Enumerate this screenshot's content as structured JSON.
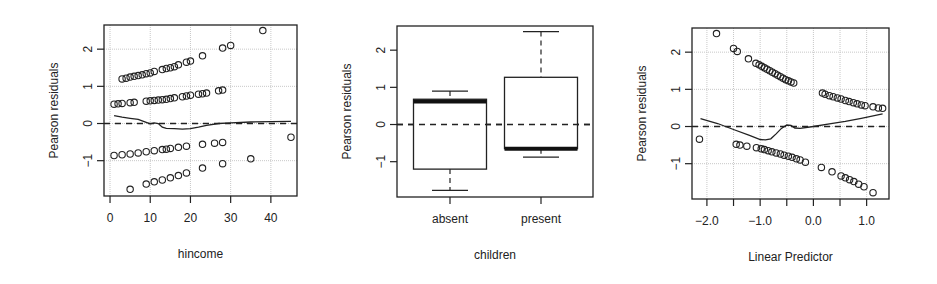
{
  "chart_data": [
    {
      "type": "scatter",
      "title": "",
      "xlabel": "hincome",
      "ylabel": "Pearson residuals",
      "xlim": [
        -1.5,
        46.5
      ],
      "ylim": [
        -1.95,
        2.65
      ],
      "xticks": [
        0,
        10,
        20,
        30,
        40
      ],
      "xtick_labels": [
        "0",
        "10",
        "20",
        "30",
        "40"
      ],
      "yticks": [
        -1,
        0,
        1,
        2
      ],
      "ytick_labels": [
        "-1",
        "0",
        "1",
        "2"
      ],
      "grid": true,
      "reference_line": {
        "y": 0,
        "style": "dashed"
      },
      "points": [
        [
          3,
          1.2
        ],
        [
          4,
          1.22
        ],
        [
          5,
          1.25
        ],
        [
          6,
          1.27
        ],
        [
          7,
          1.29
        ],
        [
          8,
          1.31
        ],
        [
          9,
          1.34
        ],
        [
          10,
          1.36
        ],
        [
          11,
          1.4
        ],
        [
          13,
          1.45
        ],
        [
          14,
          1.48
        ],
        [
          15,
          1.5
        ],
        [
          16,
          1.53
        ],
        [
          17,
          1.58
        ],
        [
          19,
          1.65
        ],
        [
          20,
          1.68
        ],
        [
          23,
          1.82
        ],
        [
          28,
          2.03
        ],
        [
          30,
          2.1
        ],
        [
          38,
          2.5
        ],
        [
          1,
          0.52
        ],
        [
          2,
          0.53
        ],
        [
          3,
          0.54
        ],
        [
          5,
          0.56
        ],
        [
          6,
          0.57
        ],
        [
          9,
          0.6
        ],
        [
          10,
          0.61
        ],
        [
          11,
          0.62
        ],
        [
          12,
          0.63
        ],
        [
          13,
          0.64
        ],
        [
          14,
          0.65
        ],
        [
          15,
          0.67
        ],
        [
          16,
          0.69
        ],
        [
          18,
          0.72
        ],
        [
          19,
          0.74
        ],
        [
          20,
          0.76
        ],
        [
          22,
          0.79
        ],
        [
          23,
          0.8
        ],
        [
          24,
          0.82
        ],
        [
          27,
          0.88
        ],
        [
          28,
          0.9
        ],
        [
          1,
          -0.86
        ],
        [
          3,
          -0.84
        ],
        [
          5,
          -0.82
        ],
        [
          7,
          -0.79
        ],
        [
          9,
          -0.76
        ],
        [
          11,
          -0.73
        ],
        [
          13,
          -0.7
        ],
        [
          14,
          -0.69
        ],
        [
          15,
          -0.67
        ],
        [
          17,
          -0.64
        ],
        [
          19,
          -0.61
        ],
        [
          23,
          -0.56
        ],
        [
          26,
          -0.53
        ],
        [
          28,
          -0.51
        ],
        [
          45,
          -0.37
        ],
        [
          5,
          -1.77
        ],
        [
          9,
          -1.63
        ],
        [
          11,
          -1.57
        ],
        [
          13,
          -1.52
        ],
        [
          15,
          -1.46
        ],
        [
          17,
          -1.4
        ],
        [
          19,
          -1.33
        ],
        [
          23,
          -1.2
        ],
        [
          28,
          -1.08
        ],
        [
          35,
          -0.95
        ]
      ],
      "smooth_line": [
        [
          1,
          0.21
        ],
        [
          3,
          0.17
        ],
        [
          5,
          0.14
        ],
        [
          7,
          0.11
        ],
        [
          9,
          0.03
        ],
        [
          10,
          -0.01
        ],
        [
          11,
          0.02
        ],
        [
          12,
          0.0
        ],
        [
          13,
          -0.1
        ],
        [
          14,
          -0.13
        ],
        [
          16,
          -0.14
        ],
        [
          18,
          -0.15
        ],
        [
          20,
          -0.14
        ],
        [
          22,
          -0.1
        ],
        [
          24,
          -0.05
        ],
        [
          27,
          0.0
        ],
        [
          30,
          0.02
        ],
        [
          35,
          0.04
        ],
        [
          40,
          0.05
        ],
        [
          45,
          0.06
        ]
      ]
    },
    {
      "type": "box",
      "title": "",
      "xlabel": "children",
      "ylabel": "Pearson residuals",
      "ylim": [
        -1.95,
        2.65
      ],
      "categories": [
        "absent",
        "present"
      ],
      "yticks": [
        -1,
        0,
        1,
        2
      ],
      "ytick_labels": [
        "-1",
        "0",
        "1",
        "2"
      ],
      "grid": false,
      "reference_line": {
        "y": 0,
        "style": "dashed"
      },
      "boxes": [
        {
          "category": "absent",
          "whisker_low": -1.77,
          "q1": -1.2,
          "median": 0.62,
          "q3": 0.68,
          "whisker_high": 0.9
        },
        {
          "category": "present",
          "whisker_low": -0.88,
          "q1": -0.65,
          "median": -0.65,
          "q3": 1.27,
          "whisker_high": 2.5
        }
      ]
    },
    {
      "type": "scatter",
      "title": "",
      "xlabel": "Linear Predictor",
      "ylabel": "Pearson residuals",
      "xlim": [
        -2.28,
        1.42
      ],
      "ylim": [
        -1.95,
        2.65
      ],
      "xticks": [
        -2.0,
        -1.5,
        -1.0,
        -0.5,
        0.0,
        0.5,
        1.0
      ],
      "xtick_labels": [
        "-2.0",
        "",
        "-1.0",
        "",
        "0.0",
        "",
        "1.0"
      ],
      "yticks": [
        -1,
        0,
        1,
        2
      ],
      "ytick_labels": [
        "-1",
        "0",
        "1",
        "2"
      ],
      "grid": true,
      "reference_line": {
        "y": 0,
        "style": "dashed"
      },
      "points": [
        [
          -1.82,
          2.5
        ],
        [
          -1.5,
          2.1
        ],
        [
          -1.43,
          2.02
        ],
        [
          -1.22,
          1.82
        ],
        [
          -1.08,
          1.7
        ],
        [
          -1.02,
          1.66
        ],
        [
          -0.97,
          1.62
        ],
        [
          -0.92,
          1.58
        ],
        [
          -0.87,
          1.54
        ],
        [
          -0.82,
          1.5
        ],
        [
          -0.77,
          1.46
        ],
        [
          -0.72,
          1.42
        ],
        [
          -0.67,
          1.38
        ],
        [
          -0.62,
          1.34
        ],
        [
          -0.57,
          1.3
        ],
        [
          -0.52,
          1.26
        ],
        [
          -0.47,
          1.23
        ],
        [
          -0.42,
          1.2
        ],
        [
          -0.37,
          1.17
        ],
        [
          0.17,
          0.9
        ],
        [
          0.22,
          0.87
        ],
        [
          0.3,
          0.83
        ],
        [
          0.37,
          0.8
        ],
        [
          0.45,
          0.77
        ],
        [
          0.52,
          0.74
        ],
        [
          0.6,
          0.7
        ],
        [
          0.67,
          0.67
        ],
        [
          0.75,
          0.64
        ],
        [
          0.82,
          0.61
        ],
        [
          0.9,
          0.58
        ],
        [
          0.97,
          0.56
        ],
        [
          1.12,
          0.53
        ],
        [
          1.22,
          0.5
        ],
        [
          1.3,
          0.49
        ],
        [
          -2.14,
          -0.34
        ],
        [
          -1.45,
          -0.48
        ],
        [
          -1.38,
          -0.5
        ],
        [
          -1.25,
          -0.53
        ],
        [
          -1.07,
          -0.57
        ],
        [
          -0.98,
          -0.6
        ],
        [
          -0.92,
          -0.62
        ],
        [
          -0.85,
          -0.65
        ],
        [
          -0.78,
          -0.68
        ],
        [
          -0.7,
          -0.71
        ],
        [
          -0.62,
          -0.74
        ],
        [
          -0.55,
          -0.77
        ],
        [
          -0.47,
          -0.8
        ],
        [
          -0.4,
          -0.83
        ],
        [
          -0.32,
          -0.87
        ],
        [
          -0.25,
          -0.9
        ],
        [
          -0.15,
          -0.96
        ],
        [
          0.15,
          -1.1
        ],
        [
          0.35,
          -1.22
        ],
        [
          0.52,
          -1.33
        ],
        [
          0.6,
          -1.38
        ],
        [
          0.68,
          -1.43
        ],
        [
          0.76,
          -1.48
        ],
        [
          0.85,
          -1.55
        ],
        [
          0.95,
          -1.62
        ],
        [
          1.12,
          -1.78
        ]
      ],
      "smooth_line": [
        [
          -2.12,
          0.21
        ],
        [
          -1.8,
          0.08
        ],
        [
          -1.5,
          -0.08
        ],
        [
          -1.2,
          -0.24
        ],
        [
          -1.0,
          -0.35
        ],
        [
          -0.9,
          -0.36
        ],
        [
          -0.8,
          -0.33
        ],
        [
          -0.7,
          -0.2
        ],
        [
          -0.6,
          -0.05
        ],
        [
          -0.5,
          0.04
        ],
        [
          -0.42,
          0.03
        ],
        [
          -0.35,
          -0.04
        ],
        [
          -0.25,
          -0.05
        ],
        [
          0.0,
          0.0
        ],
        [
          0.3,
          0.07
        ],
        [
          0.6,
          0.14
        ],
        [
          0.9,
          0.22
        ],
        [
          1.3,
          0.34
        ]
      ]
    }
  ],
  "panels": [
    {
      "xlabel": "hincome",
      "ylabel": "Pearson residuals"
    },
    {
      "xlabel": "children",
      "ylabel": "Pearson residuals",
      "categories": [
        "absent",
        "present"
      ]
    },
    {
      "xlabel": "Linear Predictor",
      "ylabel": "Pearson residuals"
    }
  ],
  "colors": {
    "ink": "#222222",
    "grid": "#c8c8c8",
    "background": "#ffffff",
    "median": "#111111"
  }
}
